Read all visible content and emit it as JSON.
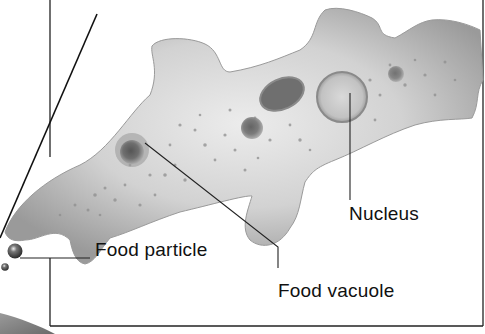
{
  "diagram": {
    "labels": {
      "food_particle": "Food particle",
      "food_vacuole": "Food vacuole",
      "nucleus": "Nucleus"
    },
    "colors": {
      "background": "#ffffff",
      "frame": "#222222",
      "body_light": "#e4e4e4",
      "body_mid": "#b8b8b8",
      "body_dark": "#8a8a8a",
      "organelle": "#6e6e6e",
      "text": "#111111"
    }
  }
}
